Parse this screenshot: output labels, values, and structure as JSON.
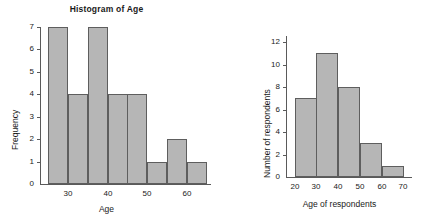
{
  "figure": {
    "background": "#ffffff",
    "bar_fill": "#b6b6b6",
    "bar_stroke": "#5e5e5e",
    "axis_color": "#5a5a5a"
  },
  "chart_data": [
    {
      "type": "bar",
      "id": "histogram-of-age",
      "title": "Histogram of Age",
      "xlabel": "Age",
      "ylabel": "Frequency",
      "grid": false,
      "legend": "none",
      "bin_width": 5,
      "bin_starts": [
        25,
        30,
        35,
        40,
        45,
        50,
        55,
        60
      ],
      "categories": [
        "25-30",
        "30-35",
        "35-40",
        "40-45",
        "45-50",
        "50-55",
        "55-60",
        "60-65"
      ],
      "values": [
        7,
        4,
        7,
        4,
        4,
        1,
        2,
        1
      ],
      "xlim": [
        23,
        66
      ],
      "ylim": [
        0,
        7
      ],
      "xticks": [
        30,
        40,
        50,
        60
      ],
      "xticklabels": [
        "30",
        "40",
        "50",
        "60"
      ],
      "yticks": [
        0,
        1,
        2,
        3,
        4,
        5,
        6,
        7
      ],
      "yticklabels": [
        "0",
        "1",
        "2",
        "3",
        "4",
        "5",
        "6",
        "7"
      ]
    },
    {
      "type": "bar",
      "id": "age-of-respondents",
      "title": "",
      "xlabel": "Age of respondents",
      "ylabel": "Number of respondents",
      "grid": false,
      "legend": "none",
      "bin_width": 10,
      "bin_starts": [
        20,
        30,
        40,
        50,
        60
      ],
      "categories": [
        "20-30",
        "30-40",
        "40-50",
        "50-60",
        "60-70"
      ],
      "values": [
        7,
        11,
        8,
        3,
        1
      ],
      "xlim": [
        16,
        74
      ],
      "ylim": [
        0,
        12
      ],
      "xticks": [
        20,
        30,
        40,
        50,
        60,
        70
      ],
      "xticklabels": [
        "20",
        "30",
        "40",
        "50",
        "60",
        "70"
      ],
      "yticks": [
        0,
        2,
        4,
        6,
        8,
        10,
        12
      ],
      "yticklabels": [
        "0",
        "2",
        "4",
        "6",
        "8",
        "10",
        "12"
      ]
    }
  ]
}
